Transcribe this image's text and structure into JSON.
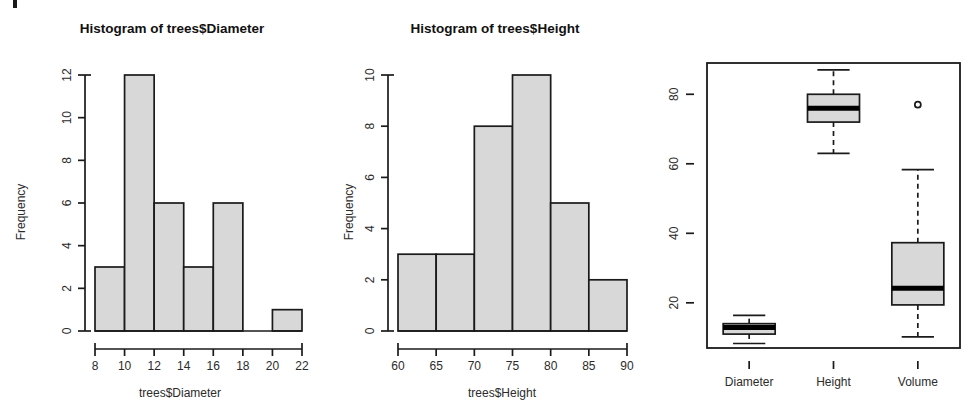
{
  "page": {
    "width": 980,
    "height": 419,
    "background": "#ffffff",
    "ink_color": "#1a1a1a",
    "bar_fill": "#d8d8d8",
    "artifact_label": "scan-mark"
  },
  "panels": [
    {
      "id": "hist-diameter",
      "kind": "histogram"
    },
    {
      "id": "hist-height",
      "kind": "histogram"
    },
    {
      "id": "boxplot",
      "kind": "boxplot"
    }
  ],
  "chart_data": [
    {
      "type": "bar",
      "id": "hist-diameter",
      "title": "Histogram of trees$Diameter",
      "xlabel": "trees$Diameter",
      "ylabel": "Frequency",
      "bin_width": 2,
      "bin_edges": [
        8,
        10,
        12,
        14,
        16,
        18,
        20,
        22
      ],
      "categories": [
        "8-10",
        "10-12",
        "12-14",
        "14-16",
        "16-18",
        "18-20",
        "20-22"
      ],
      "values": [
        3,
        12,
        6,
        3,
        6,
        0,
        1
      ],
      "xlim": [
        8,
        22
      ],
      "ylim": [
        0,
        12
      ],
      "xticks": [
        8,
        10,
        12,
        14,
        16,
        18,
        20,
        22
      ],
      "yticks": [
        0,
        2,
        4,
        6,
        8,
        10,
        12
      ],
      "grid": false,
      "legend": "none"
    },
    {
      "type": "bar",
      "id": "hist-height",
      "title": "Histogram of trees$Height",
      "xlabel": "trees$Height",
      "ylabel": "Frequency",
      "bin_width": 5,
      "bin_edges": [
        60,
        65,
        70,
        75,
        80,
        85,
        90
      ],
      "categories": [
        "60-65",
        "65-70",
        "70-75",
        "75-80",
        "80-85",
        "85-90"
      ],
      "values": [
        3,
        3,
        8,
        10,
        5,
        2
      ],
      "xlim": [
        60,
        90
      ],
      "ylim": [
        0,
        10
      ],
      "xticks": [
        60,
        65,
        70,
        75,
        80,
        85,
        90
      ],
      "yticks": [
        0,
        2,
        4,
        6,
        8,
        10
      ],
      "grid": false,
      "legend": "none"
    },
    {
      "type": "boxplot",
      "id": "boxplot",
      "title": "",
      "xlabel": "",
      "ylabel": "",
      "categories": [
        "Diameter",
        "Height",
        "Volume"
      ],
      "ylim": [
        7,
        89
      ],
      "yticks": [
        20,
        40,
        60,
        80
      ],
      "grid": false,
      "legend": "none",
      "boxes": [
        {
          "name": "Diameter",
          "whisker_low": 8.3,
          "q1": 11.0,
          "median": 12.9,
          "q3": 14.0,
          "whisker_high": 16.4,
          "outliers": []
        },
        {
          "name": "Height",
          "whisker_low": 63,
          "q1": 72,
          "median": 76,
          "q3": 80,
          "whisker_high": 87,
          "outliers": []
        },
        {
          "name": "Volume",
          "whisker_low": 10.2,
          "q1": 19.4,
          "median": 24.2,
          "q3": 37.3,
          "whisker_high": 58.3,
          "outliers": [
            77
          ]
        }
      ]
    }
  ]
}
